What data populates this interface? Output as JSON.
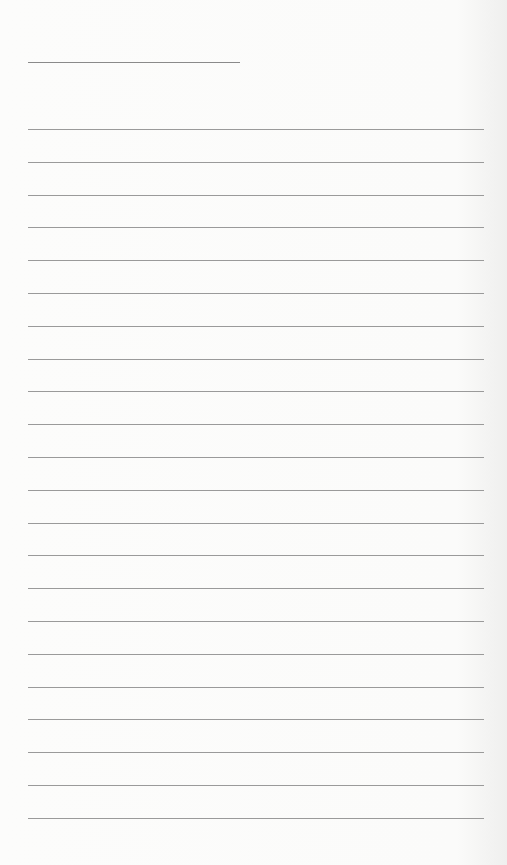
{
  "page": {
    "type": "lined-notepaper",
    "background_color": "#fbfbfa",
    "line_color": "#9a9a9a",
    "title_line": {
      "x": 28,
      "y": 62,
      "width": 212
    },
    "rules": {
      "count": 22,
      "first_y": 129,
      "spacing": 32.8,
      "x": 28,
      "width": 456
    }
  }
}
